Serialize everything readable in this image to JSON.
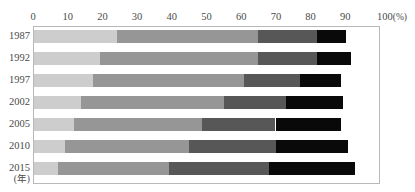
{
  "title": "",
  "axis": {
    "x_unit": "(%)",
    "x_ticks": [
      "0",
      "10",
      "20",
      "30",
      "40",
      "50",
      "60",
      "70",
      "80",
      "90",
      "100"
    ],
    "y_unit": "(年)"
  },
  "chart_data": {
    "type": "bar",
    "orientation": "horizontal",
    "stacked": true,
    "title": "",
    "xlabel": "(%)",
    "ylabel": "(年)",
    "xlim": [
      0,
      100
    ],
    "grid": false,
    "legend": "none",
    "categories": [
      "1987",
      "1992",
      "1997",
      "2002",
      "2005",
      "2010",
      "2015"
    ],
    "series": [
      {
        "name": "segment-1",
        "color": "#cdcdcd",
        "values": [
          24,
          19,
          17,
          13.5,
          11.7,
          9,
          7
        ]
      },
      {
        "name": "segment-2",
        "color": "#969696",
        "values": [
          41,
          46,
          44,
          41.5,
          37,
          36,
          32
        ]
      },
      {
        "name": "segment-3",
        "color": "#575757",
        "values": [
          17,
          17,
          16,
          18,
          21.3,
          25,
          29
        ]
      },
      {
        "name": "segment-4",
        "color": "#090909",
        "values": [
          8.5,
          10,
          12,
          16.5,
          19,
          21,
          25
        ]
      },
      {
        "name": "segment-5",
        "color": "#ffffff",
        "values": [
          9.5,
          8,
          11,
          10.5,
          11,
          9,
          7
        ]
      }
    ],
    "cumulative_edges": [
      [
        24,
        65,
        82,
        90.5,
        100
      ],
      [
        19,
        65,
        82,
        92,
        100
      ],
      [
        17,
        61,
        77,
        89,
        100
      ],
      [
        13.5,
        55,
        73,
        89.5,
        100
      ],
      [
        11.7,
        48.7,
        70,
        89,
        100
      ],
      [
        9,
        45,
        70,
        91,
        100
      ],
      [
        7,
        39,
        68,
        93,
        100
      ]
    ]
  }
}
